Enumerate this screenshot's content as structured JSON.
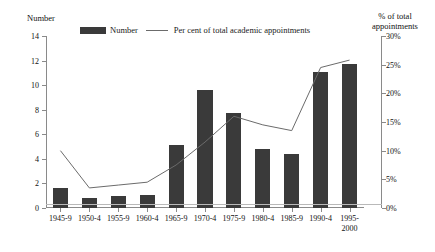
{
  "chart_data": {
    "type": "bar",
    "title": "",
    "categories": [
      "1945-9",
      "1950-4",
      "1955-9",
      "1960-4",
      "1965-9",
      "1970-4",
      "1975-9",
      "1980-4",
      "1985-9",
      "1990-4",
      "1995-\n2000"
    ],
    "series": [
      {
        "name": "Number",
        "type": "bar",
        "values": [
          1.6,
          0.8,
          1.0,
          1.1,
          5.1,
          9.6,
          7.7,
          4.8,
          4.4,
          11.1,
          11.7
        ],
        "axis": "left"
      },
      {
        "name": "Per cent of total academic appointments",
        "type": "line",
        "values": [
          10.0,
          3.5,
          4.0,
          4.5,
          7.5,
          11.5,
          16.0,
          14.5,
          13.5,
          24.5,
          25.8
        ],
        "axis": "right"
      }
    ],
    "left_axis": {
      "label": "Number",
      "ticks": [
        "0",
        "2",
        "4",
        "6",
        "8",
        "10",
        "12",
        "14"
      ],
      "values": [
        0,
        2,
        4,
        6,
        8,
        10,
        12,
        14
      ],
      "ylim": [
        0,
        14
      ]
    },
    "right_axis": {
      "label": "% of total\nappointments",
      "ticks": [
        "0%",
        "5%",
        "10%",
        "15%",
        "20%",
        "25%",
        "30%"
      ],
      "values": [
        0,
        5,
        10,
        15,
        20,
        25,
        30
      ],
      "ylim": [
        0,
        30
      ]
    },
    "xlabel": "",
    "grid": false,
    "legend": {
      "position": "top",
      "entries": [
        {
          "label": "Number",
          "marker": "bar-swatch",
          "color": "#3a3a3a"
        },
        {
          "label": "Per cent of total academic appointments",
          "marker": "line-swatch",
          "color": "#6b6b6b"
        }
      ]
    },
    "colors": {
      "bar": "#3a3a3a",
      "line": "#6b6b6b",
      "axis": "#8a8a8a",
      "text": "#111111"
    }
  }
}
